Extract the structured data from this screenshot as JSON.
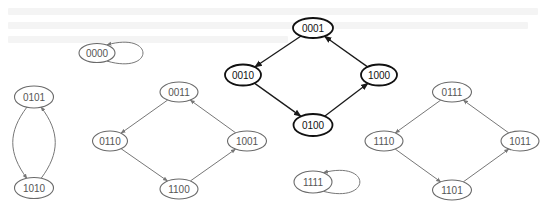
{
  "diagram": {
    "title": "",
    "colors": {
      "background": "#ffffff",
      "highlight_stroke": "#111111",
      "normal_stroke": "#6a6a6a",
      "normal_text": "#555555"
    },
    "nodes": [
      {
        "id": "0000",
        "label": "0000",
        "cx": 97,
        "cy": 53,
        "rx": 18,
        "ry": 9.5,
        "style": "light"
      },
      {
        "id": "0101",
        "label": "0101",
        "cx": 34,
        "cy": 97,
        "rx": 19.5,
        "ry": 11,
        "style": "light"
      },
      {
        "id": "1010",
        "label": "1010",
        "cx": 34,
        "cy": 188,
        "rx": 19.5,
        "ry": 10.5,
        "style": "light"
      },
      {
        "id": "0011",
        "label": "0011",
        "cx": 179,
        "cy": 92,
        "rx": 19,
        "ry": 10,
        "style": "light"
      },
      {
        "id": "0110",
        "label": "0110",
        "cx": 110,
        "cy": 141,
        "rx": 17.5,
        "ry": 10,
        "style": "light"
      },
      {
        "id": "1001",
        "label": "1001",
        "cx": 247,
        "cy": 141,
        "rx": 19.5,
        "ry": 10,
        "style": "light"
      },
      {
        "id": "1100",
        "label": "1100",
        "cx": 179,
        "cy": 189,
        "rx": 19,
        "ry": 10,
        "style": "light"
      },
      {
        "id": "0001",
        "label": "0001",
        "cx": 313,
        "cy": 28,
        "rx": 20,
        "ry": 10,
        "style": "bold"
      },
      {
        "id": "0010",
        "label": "0010",
        "cx": 243,
        "cy": 75,
        "rx": 18,
        "ry": 10.5,
        "style": "bold"
      },
      {
        "id": "1000",
        "label": "1000",
        "cx": 379,
        "cy": 75,
        "rx": 18,
        "ry": 10.5,
        "style": "bold"
      },
      {
        "id": "0100",
        "label": "0100",
        "cx": 313,
        "cy": 125,
        "rx": 19.5,
        "ry": 11,
        "style": "bold"
      },
      {
        "id": "0111",
        "label": "0111",
        "cx": 452,
        "cy": 92,
        "rx": 19.5,
        "ry": 10,
        "style": "light"
      },
      {
        "id": "1110",
        "label": "1110",
        "cx": 384,
        "cy": 141,
        "rx": 19,
        "ry": 10,
        "style": "light"
      },
      {
        "id": "1011",
        "label": "1011",
        "cx": 520,
        "cy": 141,
        "rx": 19,
        "ry": 10,
        "style": "light"
      },
      {
        "id": "1101",
        "label": "1101",
        "cx": 452,
        "cy": 190,
        "rx": 19.5,
        "ry": 10,
        "style": "light"
      },
      {
        "id": "1111",
        "label": "1111",
        "cx": 313,
        "cy": 182,
        "rx": 19,
        "ry": 11,
        "style": "light"
      }
    ],
    "edges": [
      {
        "from": "0000",
        "to": "0000",
        "type": "self-loop",
        "style": "light"
      },
      {
        "from": "0101",
        "to": "1010",
        "type": "curve-left",
        "style": "light"
      },
      {
        "from": "1010",
        "to": "0101",
        "type": "curve-right",
        "style": "light"
      },
      {
        "from": "0011",
        "to": "0110",
        "style": "light"
      },
      {
        "from": "0110",
        "to": "1100",
        "style": "light"
      },
      {
        "from": "1100",
        "to": "1001",
        "style": "light"
      },
      {
        "from": "1001",
        "to": "0011",
        "style": "light"
      },
      {
        "from": "0001",
        "to": "0010",
        "style": "bold"
      },
      {
        "from": "0010",
        "to": "0100",
        "style": "bold"
      },
      {
        "from": "0100",
        "to": "1000",
        "style": "bold"
      },
      {
        "from": "1000",
        "to": "0001",
        "style": "bold"
      },
      {
        "from": "0111",
        "to": "1110",
        "style": "light"
      },
      {
        "from": "1110",
        "to": "1101",
        "style": "light"
      },
      {
        "from": "1101",
        "to": "1011",
        "style": "light"
      },
      {
        "from": "1011",
        "to": "0111",
        "style": "light"
      },
      {
        "from": "1111",
        "to": "1111",
        "type": "self-loop",
        "style": "light"
      }
    ]
  }
}
